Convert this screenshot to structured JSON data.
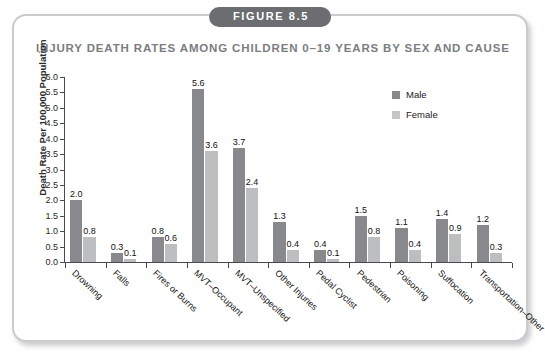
{
  "figure": {
    "badge": "FIGURE 8.5",
    "title": "INJURY DEATH RATES AMONG CHILDREN 0–19 YEARS BY SEX AND CAUSE"
  },
  "legend": {
    "male_label": "Male",
    "female_label": "Female",
    "male_color": "#87898c",
    "female_color": "#bcbec0"
  },
  "chart_data": {
    "type": "bar",
    "title": "INJURY DEATH RATES AMONG CHILDREN 0–19 YEARS BY SEX AND CAUSE",
    "xlabel": "",
    "ylabel": "Death Rate Per 100,000 Population",
    "ylim": [
      0,
      6.0
    ],
    "ytick_step": 0.5,
    "yticks": [
      "0.0",
      "0.5",
      "1.0",
      "1.5",
      "2.0",
      "2.5",
      "3.0",
      "3.5",
      "4.0",
      "4.5",
      "5.0",
      "5.5",
      "6.0"
    ],
    "grid": false,
    "legend_position": "top-right",
    "categories": [
      "Drowning",
      "Falls",
      "Fires or Burns",
      "MVT–Occupant",
      "MVT–Unspecified",
      "Other Injuries",
      "Pedal Cyclist",
      "Pedestrian",
      "Poisoning",
      "Suffocation",
      "Transportation–Other"
    ],
    "series": [
      {
        "name": "Male",
        "color": "#87898c",
        "values": [
          2.0,
          0.3,
          0.8,
          5.6,
          3.7,
          1.3,
          0.4,
          1.5,
          1.1,
          1.4,
          1.2
        ],
        "labels": [
          "2.0",
          "0.3",
          "0.8",
          "5.6",
          "3.7",
          "1.3",
          "0.4",
          "1.5",
          "1.1",
          "1.4",
          "1.2"
        ]
      },
      {
        "name": "Female",
        "color": "#bcbec0",
        "values": [
          0.8,
          0.1,
          0.6,
          3.6,
          2.4,
          0.4,
          0.1,
          0.8,
          0.4,
          0.9,
          0.3
        ],
        "labels": [
          "0.8",
          "0.1",
          "0.6",
          "3.6",
          "2.4",
          "0.4",
          "0.1",
          "0.8",
          "0.4",
          "0.9",
          "0.3"
        ]
      }
    ]
  }
}
